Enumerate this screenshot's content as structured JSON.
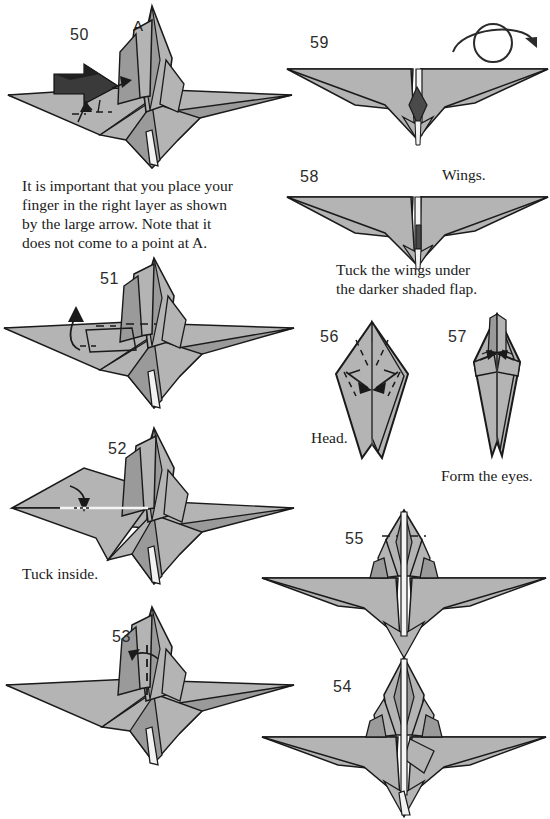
{
  "document": {
    "type": "origami-instruction-diagram",
    "subject": "folded bird / crane figure",
    "background_color": "#ffffff",
    "page_width": 550,
    "page_height": 819
  },
  "colors": {
    "paper_light": "#b4b4b4",
    "paper_mid": "#9a9a9a",
    "paper_dark": "#4a4a4a",
    "paper_white": "#f2f2f2",
    "outline": "#1a1a1a",
    "text": "#1a1a1a",
    "arrow": "#222222"
  },
  "steps": [
    {
      "number": "50",
      "number_x": 70,
      "number_y": 26,
      "point_label": "A",
      "point_label_x": 133,
      "point_label_y": 17,
      "caption_lines": [
        "It is important that you place your",
        "finger in the right layer as shown",
        "by the large arrow.  Note that it",
        "does not come to a point at A."
      ],
      "caption_x": 22,
      "caption_y": 176,
      "view": "three-quarter",
      "has_large_arrow": true
    },
    {
      "number": "51",
      "number_x": 100,
      "number_y": 270,
      "caption_lines": [],
      "view": "three-quarter"
    },
    {
      "number": "52",
      "number_x": 108,
      "number_y": 440,
      "caption_lines": [
        "Tuck inside."
      ],
      "caption_x": 22,
      "caption_y": 565,
      "view": "three-quarter"
    },
    {
      "number": "53",
      "number_x": 112,
      "number_y": 628,
      "caption_lines": [],
      "view": "three-quarter"
    },
    {
      "number": "54",
      "number_x": 333,
      "number_y": 678,
      "caption_lines": [],
      "view": "front"
    },
    {
      "number": "55",
      "number_x": 345,
      "number_y": 530,
      "caption_lines": [],
      "view": "front"
    },
    {
      "number": "56",
      "number_x": 320,
      "number_y": 328,
      "caption_lines": [
        "Head."
      ],
      "caption_x": 311,
      "caption_y": 428,
      "view": "head-kite"
    },
    {
      "number": "57",
      "number_x": 448,
      "number_y": 328,
      "caption_lines": [
        "Form the eyes."
      ],
      "caption_x": 441,
      "caption_y": 466,
      "view": "head-narrow"
    },
    {
      "number": "58",
      "number_x": 300,
      "number_y": 168,
      "caption_lines": [
        "Tuck the wings under",
        "the darker shaded flap."
      ],
      "caption_x": 336,
      "caption_y": 260,
      "side_label": "Wings.",
      "side_label_x": 442,
      "side_label_y": 168,
      "view": "wing-span"
    },
    {
      "number": "59",
      "number_x": 310,
      "number_y": 34,
      "caption_lines": [],
      "view": "wing-span-dark-flap",
      "has_rotate_icon": true
    }
  ],
  "icons": {
    "rotate_over_icon": {
      "name": "rotate-over-icon",
      "x": 447,
      "y": 18,
      "width": 95,
      "height": 48
    }
  }
}
